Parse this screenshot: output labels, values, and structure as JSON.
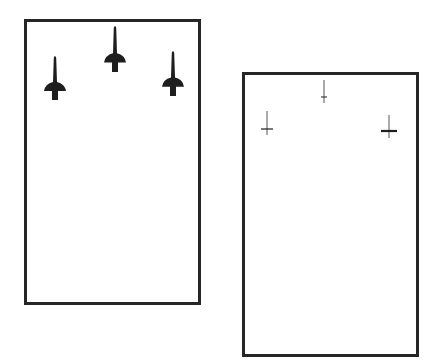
{
  "figure": {
    "panels": [
      {
        "id": "left-panel",
        "frame": {
          "x": 24,
          "y": 19,
          "width": 177,
          "height": 286
        },
        "marker_style": "rocket-silhouette",
        "markers": [
          {
            "cx": 55,
            "top": 55,
            "bottom": 100
          },
          {
            "cx": 115,
            "top": 25,
            "bottom": 72
          },
          {
            "cx": 173,
            "top": 50,
            "bottom": 96
          }
        ]
      },
      {
        "id": "right-panel",
        "frame": {
          "x": 242,
          "y": 72,
          "width": 177,
          "height": 285
        },
        "marker_style": "thin-cross",
        "markers": [
          {
            "cx": 267,
            "top": 111,
            "bottom": 135,
            "bar_y": 129,
            "bar_half": 6,
            "bar_weight": 1.2
          },
          {
            "cx": 324,
            "top": 80,
            "bottom": 103,
            "bar_y": 97,
            "bar_half": 3,
            "bar_weight": 1.0
          },
          {
            "cx": 389,
            "top": 115,
            "bottom": 138,
            "bar_y": 131,
            "bar_half": 8,
            "bar_weight": 2.2
          }
        ]
      }
    ],
    "colors": {
      "stroke": "#262626",
      "marker_dark": "#1e1e1e",
      "marker_faint": "#555555",
      "background": "#ffffff"
    }
  }
}
